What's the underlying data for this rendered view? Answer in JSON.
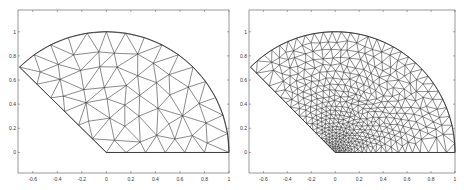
{
  "chart_data": [
    {
      "type": "mesh",
      "title": "",
      "xlabel": "",
      "ylabel": "",
      "description": "Coarse unstructured triangular mesh of a circular sector (unit radius, angle 0 to 135 degrees)",
      "xlim": [
        -0.72,
        1.0
      ],
      "ylim": [
        -0.17,
        1.18
      ],
      "xticks": [
        "-0.6",
        "-0.4",
        "-0.2",
        "0",
        "0.2",
        "0.4",
        "0.6",
        "0.8",
        "1"
      ],
      "xtick_values": [
        -0.6,
        -0.4,
        -0.2,
        0,
        0.2,
        0.4,
        0.6,
        0.8,
        1
      ],
      "yticks": [
        "0",
        "0.2",
        "0.4",
        "0.6",
        "0.8",
        "1"
      ],
      "ytick_values": [
        0,
        0.2,
        0.4,
        0.6,
        0.8,
        1
      ],
      "sector": {
        "radius": 1,
        "angle_start_deg": 0,
        "angle_end_deg": 135
      },
      "refinement": "uniform",
      "mesh_size": 0.16,
      "grid": false
    },
    {
      "type": "mesh",
      "title": "",
      "xlabel": "",
      "ylabel": "",
      "description": "Refined unstructured triangular mesh of the same sector, graded toward the origin corner",
      "xlim": [
        -0.72,
        1.0
      ],
      "ylim": [
        -0.17,
        1.18
      ],
      "xticks": [
        "-0.6",
        "-0.4",
        "-0.2",
        "0",
        "0.2",
        "0.4",
        "0.6",
        "0.8",
        "1"
      ],
      "xtick_values": [
        -0.6,
        -0.4,
        -0.2,
        0,
        0.2,
        0.4,
        0.6,
        0.8,
        1
      ],
      "yticks": [
        "0",
        "0.2",
        "0.4",
        "0.6",
        "0.8",
        "1"
      ],
      "ytick_values": [
        0,
        0.2,
        0.4,
        0.6,
        0.8,
        1
      ],
      "sector": {
        "radius": 1,
        "angle_start_deg": 0,
        "angle_end_deg": 135
      },
      "refinement": "graded toward origin",
      "mesh_size": 0.075,
      "grid": false
    }
  ],
  "panels": [
    {
      "box": {
        "x": 18,
        "y": 10,
        "w": 211,
        "h": 163
      }
    },
    {
      "box": {
        "x": 249,
        "y": 10,
        "w": 206,
        "h": 163
      }
    }
  ],
  "colors": {
    "line": "#2a2a2a",
    "axis": "#555555",
    "background": "#ffffff"
  }
}
